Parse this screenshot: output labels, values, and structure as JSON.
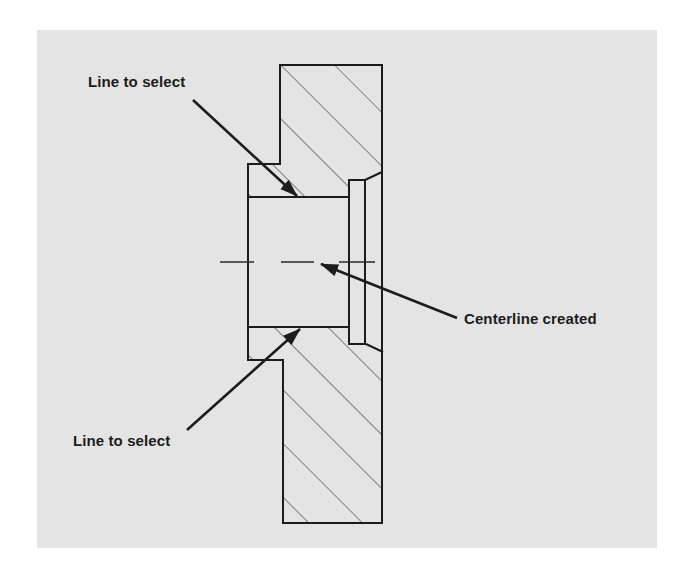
{
  "figure": {
    "background_color": "#e4e4e4",
    "line_color": "#1c1c1c",
    "hatch_color": "#3a3a3a"
  },
  "annotations": {
    "upper_label": "Line to select",
    "lower_label": "Line to select",
    "centerline_label": "Centerline created"
  },
  "geometry": {
    "part_outline": "M280,65 L382,65 L382,172 L365,180 L349,180 L349,197 L248,197 L248,164 L280,164 Z",
    "part_outline_lower": "M248,327 L349,327 L349,344 L366,344 L383,352 L383,523 L283,523 L283,360 L248,360 Z",
    "bore": "M248,197 L349,197 L349,327 L248,327 Z",
    "counterbore": "M349,180 L365,180 L365,344 L349,344 Z",
    "centerline_y": 262,
    "centerline_dashes": [
      [
        220,
        254
      ],
      [
        281,
        314
      ],
      [
        339,
        375
      ]
    ]
  }
}
